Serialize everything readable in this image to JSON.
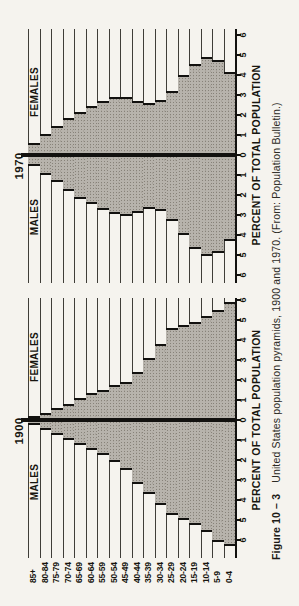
{
  "figure": {
    "caption_label": "Figure 10 – 3",
    "caption_text": "United States population pyramids, 1900 and 1970. (From: Population Bulletin.)"
  },
  "axis": {
    "label": "PERCENT OF TOTAL POPULATION",
    "tick_labels": [
      "6",
      "5",
      "4",
      "3",
      "2",
      "1",
      "0",
      "1",
      "2",
      "3",
      "4",
      "5",
      "6"
    ]
  },
  "ages": [
    "85+",
    "80-84",
    "75-79",
    "70-74",
    "65-69",
    "60-64",
    "55-59",
    "50-54",
    "45-49",
    "40-44",
    "35-39",
    "30-34",
    "25-29",
    "20-24",
    "15-19",
    "10-14",
    "5-9",
    "0-4"
  ],
  "charts": [
    {
      "year": "1900",
      "males_label": "MALES",
      "females_label": "FEMALES",
      "male_pct": [
        0.25,
        0.5,
        0.75,
        1.0,
        1.25,
        1.5,
        1.75,
        2.1,
        2.5,
        3.2,
        3.7,
        4.25,
        4.75,
        5.0,
        5.25,
        5.6,
        6.1,
        6.3
      ],
      "female_pct": [
        0.2,
        0.35,
        0.6,
        0.8,
        1.1,
        1.35,
        1.5,
        1.75,
        1.9,
        2.4,
        3.1,
        3.8,
        4.6,
        4.75,
        4.9,
        5.2,
        5.5,
        5.9
      ]
    },
    {
      "year": "1970",
      "males_label": "MALES",
      "females_label": "FEMALES",
      "male_pct": [
        0.55,
        1.0,
        1.35,
        1.8,
        2.2,
        2.45,
        2.75,
        2.95,
        3.05,
        2.9,
        2.7,
        2.8,
        3.3,
        4.0,
        4.7,
        5.05,
        4.9,
        4.3
      ],
      "female_pct": [
        0.6,
        1.05,
        1.45,
        1.85,
        2.15,
        2.45,
        2.7,
        2.9,
        2.9,
        2.7,
        2.6,
        2.75,
        3.2,
        4.0,
        4.55,
        4.9,
        4.75,
        4.15
      ]
    }
  ],
  "chart_data": [
    {
      "type": "bar",
      "subtype": "population-pyramid",
      "title": "1900",
      "categories": [
        "85+",
        "80-84",
        "75-79",
        "70-74",
        "65-69",
        "60-64",
        "55-59",
        "50-54",
        "45-49",
        "40-44",
        "35-39",
        "30-34",
        "25-29",
        "20-24",
        "15-19",
        "10-14",
        "5-9",
        "0-4"
      ],
      "series": [
        {
          "name": "MALES",
          "values": [
            0.25,
            0.5,
            0.75,
            1.0,
            1.25,
            1.5,
            1.75,
            2.1,
            2.5,
            3.2,
            3.7,
            4.25,
            4.75,
            5.0,
            5.25,
            5.6,
            6.1,
            6.3
          ]
        },
        {
          "name": "FEMALES",
          "values": [
            0.2,
            0.35,
            0.6,
            0.8,
            1.1,
            1.35,
            1.5,
            1.75,
            1.9,
            2.4,
            3.1,
            3.8,
            4.6,
            4.75,
            4.9,
            5.2,
            5.5,
            5.9
          ]
        }
      ],
      "xlabel": "PERCENT OF TOTAL POPULATION",
      "ylabel": "Age group",
      "xlim": [
        -6,
        6
      ],
      "x_ticks": [
        6,
        5,
        4,
        3,
        2,
        1,
        0,
        1,
        2,
        3,
        4,
        5,
        6
      ],
      "grid": "horizontal rules per age band",
      "legend_position": "MALES left, FEMALES right, year above center axis"
    },
    {
      "type": "bar",
      "subtype": "population-pyramid",
      "title": "1970",
      "categories": [
        "85+",
        "80-84",
        "75-79",
        "70-74",
        "65-69",
        "60-64",
        "55-59",
        "50-54",
        "45-49",
        "40-44",
        "35-39",
        "30-34",
        "25-29",
        "20-24",
        "15-19",
        "10-14",
        "5-9",
        "0-4"
      ],
      "series": [
        {
          "name": "MALES",
          "values": [
            0.55,
            1.0,
            1.35,
            1.8,
            2.2,
            2.45,
            2.75,
            2.95,
            3.05,
            2.9,
            2.7,
            2.8,
            3.3,
            4.0,
            4.7,
            5.05,
            4.9,
            4.3
          ]
        },
        {
          "name": "FEMALES",
          "values": [
            0.6,
            1.05,
            1.45,
            1.85,
            2.15,
            2.45,
            2.7,
            2.9,
            2.9,
            2.7,
            2.6,
            2.75,
            3.2,
            4.0,
            4.55,
            4.9,
            4.75,
            4.15
          ]
        }
      ],
      "xlabel": "PERCENT OF TOTAL POPULATION",
      "ylabel": "Age group",
      "xlim": [
        -6,
        6
      ],
      "x_ticks": [
        6,
        5,
        4,
        3,
        2,
        1,
        0,
        1,
        2,
        3,
        4,
        5,
        6
      ],
      "grid": "horizontal rules per age band",
      "legend_position": "MALES left, FEMALES right, year above center axis"
    }
  ],
  "colors": {
    "background": "#f5f3ee",
    "ink": "#12110f",
    "bar_fill": "#b7b3ac"
  },
  "orientation_note": "entire figure rotated 90 degrees counter-clockwise"
}
